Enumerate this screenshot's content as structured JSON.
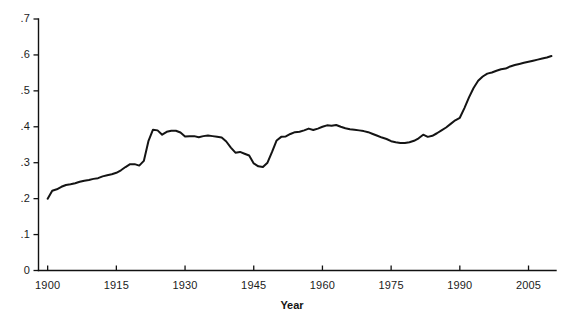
{
  "chart_data": {
    "type": "line",
    "title": "",
    "subtitle": "",
    "xlabel": "Year",
    "ylabel": "",
    "xlim": [
      1898,
      2011
    ],
    "ylim": [
      0,
      0.7
    ],
    "grid": false,
    "legend": null,
    "x_ticks": [
      1900,
      1915,
      1930,
      1945,
      1960,
      1975,
      1990,
      2005
    ],
    "x_tick_labels": [
      "1900",
      "1915",
      "1930",
      "1945",
      "1960",
      "1975",
      "1990",
      "2005"
    ],
    "y_ticks": [
      0,
      0.1,
      0.2,
      0.3,
      0.4,
      0.5,
      0.6,
      0.7
    ],
    "y_tick_labels": [
      "0",
      ".1",
      ".2",
      ".3",
      ".4",
      ".5",
      ".6",
      ".7"
    ],
    "line_color": "#141414",
    "series": [
      {
        "name": "value",
        "x": [
          1900,
          1901,
          1902,
          1903,
          1904,
          1905,
          1906,
          1907,
          1908,
          1909,
          1910,
          1911,
          1912,
          1913,
          1914,
          1915,
          1916,
          1917,
          1918,
          1919,
          1920,
          1921,
          1922,
          1923,
          1924,
          1925,
          1926,
          1927,
          1928,
          1929,
          1930,
          1931,
          1932,
          1933,
          1934,
          1935,
          1936,
          1937,
          1938,
          1939,
          1940,
          1941,
          1942,
          1943,
          1944,
          1945,
          1946,
          1947,
          1948,
          1949,
          1950,
          1951,
          1952,
          1953,
          1954,
          1955,
          1956,
          1957,
          1958,
          1959,
          1960,
          1961,
          1962,
          1963,
          1964,
          1965,
          1966,
          1967,
          1968,
          1969,
          1970,
          1971,
          1972,
          1973,
          1974,
          1975,
          1976,
          1977,
          1978,
          1979,
          1980,
          1981,
          1982,
          1983,
          1984,
          1985,
          1986,
          1987,
          1988,
          1989,
          1990,
          1991,
          1992,
          1993,
          1994,
          1995,
          1996,
          1997,
          1998,
          1999,
          2000,
          2001,
          2002,
          2003,
          2004,
          2005,
          2006,
          2007,
          2008,
          2009,
          2010
        ],
        "values": [
          0.2,
          0.222,
          0.226,
          0.233,
          0.238,
          0.24,
          0.243,
          0.247,
          0.25,
          0.252,
          0.255,
          0.257,
          0.262,
          0.265,
          0.268,
          0.272,
          0.279,
          0.288,
          0.296,
          0.296,
          0.292,
          0.305,
          0.36,
          0.392,
          0.39,
          0.378,
          0.386,
          0.389,
          0.389,
          0.384,
          0.373,
          0.374,
          0.374,
          0.371,
          0.374,
          0.376,
          0.374,
          0.372,
          0.37,
          0.359,
          0.342,
          0.328,
          0.33,
          0.325,
          0.32,
          0.298,
          0.29,
          0.288,
          0.3,
          0.33,
          0.362,
          0.372,
          0.373,
          0.38,
          0.385,
          0.386,
          0.39,
          0.395,
          0.391,
          0.395,
          0.4,
          0.404,
          0.403,
          0.405,
          0.4,
          0.396,
          0.393,
          0.392,
          0.39,
          0.388,
          0.385,
          0.38,
          0.375,
          0.37,
          0.366,
          0.36,
          0.357,
          0.355,
          0.355,
          0.357,
          0.361,
          0.368,
          0.378,
          0.372,
          0.375,
          0.382,
          0.39,
          0.398,
          0.408,
          0.418,
          0.425,
          0.452,
          0.482,
          0.508,
          0.528,
          0.54,
          0.548,
          0.551,
          0.556,
          0.56,
          0.562,
          0.568,
          0.572,
          0.575,
          0.578,
          0.581,
          0.584,
          0.587,
          0.59,
          0.593,
          0.597
        ]
      }
    ]
  },
  "axes": {
    "x_title": "Year"
  }
}
